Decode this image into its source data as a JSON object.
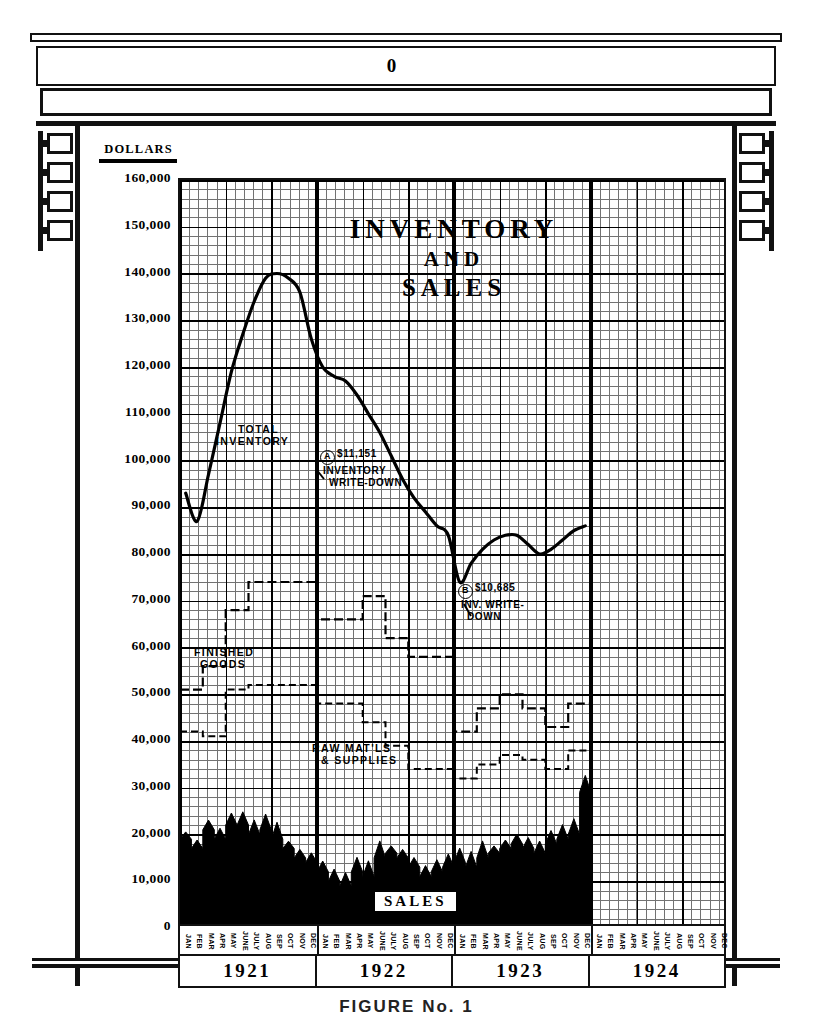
{
  "frame": {
    "header_mark": "0",
    "bracket_block_count": 4
  },
  "chart": {
    "title_line1": "INVENTORY",
    "title_line2": "AND",
    "title_line3": "SALES",
    "y_axis_header": "DOLLARS",
    "y_tick_labels": [
      "160,000",
      "150,000",
      "140,000",
      "130,000",
      "120,000",
      "110,000",
      "100,000",
      "90,000",
      "80,000",
      "70,000",
      "60,000",
      "50,000",
      "40,000",
      "30,000",
      "20,000",
      "10,000",
      "0"
    ],
    "series_label_total_inventory_l1": "TOTAL",
    "series_label_total_inventory_l2": "INVENTORY",
    "series_label_finished_goods_l1": "FINISHED",
    "series_label_finished_goods_l2": "GOODS",
    "series_label_raw_materials_l1": "RAW MAT'LS",
    "series_label_raw_materials_l2": "& SUPPLIES",
    "series_label_sales": "SALES",
    "annotation_a_marker": "A",
    "annotation_a_amount": "$11,151",
    "annotation_a_line2": "INVENTORY",
    "annotation_a_line3": "WRITE-DOWN",
    "annotation_b_marker": "B",
    "annotation_b_amount": "$10,685",
    "annotation_b_line2": "INV. WRITE-",
    "annotation_b_line3": "DOWN",
    "year_labels": [
      "1921",
      "1922",
      "1923",
      "1924"
    ],
    "month_labels": [
      "JAN",
      "FEB",
      "MAR",
      "APR",
      "MAY",
      "JUNE",
      "JULY",
      "AUG",
      "SEP",
      "OCT",
      "NOV",
      "DEC"
    ],
    "ink_color": "#000000",
    "grid_color": "#5a5a5a",
    "paper_color": "#ffffff"
  },
  "caption": "FIGURE  No. 1",
  "chart_data": {
    "type": "line",
    "title": "INVENTORY AND SALES",
    "xlabel": "",
    "ylabel": "DOLLARS",
    "ylim": [
      0,
      165000
    ],
    "ytick_step": 10000,
    "grid": true,
    "legend": "inline-labels",
    "x": [
      "1921-JAN",
      "1921-FEB",
      "1921-MAR",
      "1921-APR",
      "1921-MAY",
      "1921-JUNE",
      "1921-JULY",
      "1921-AUG",
      "1921-SEP",
      "1921-OCT",
      "1921-NOV",
      "1921-DEC",
      "1922-JAN",
      "1922-FEB",
      "1922-MAR",
      "1922-APR",
      "1922-MAY",
      "1922-JUNE",
      "1922-JULY",
      "1922-AUG",
      "1922-SEP",
      "1922-OCT",
      "1922-NOV",
      "1922-DEC",
      "1923-JAN",
      "1923-FEB",
      "1923-MAR",
      "1923-APR",
      "1923-MAY",
      "1923-JUNE",
      "1923-JULY",
      "1923-AUG",
      "1923-SEP",
      "1923-OCT",
      "1923-NOV",
      "1923-DEC"
    ],
    "series": [
      {
        "name": "TOTAL INVENTORY",
        "style": "solid-line",
        "values": [
          93000,
          87000,
          97000,
          108000,
          119000,
          127000,
          134000,
          139000,
          140000,
          139000,
          136000,
          126000,
          120000,
          118000,
          117000,
          114000,
          110000,
          106000,
          101000,
          96000,
          92000,
          89000,
          86000,
          84000,
          74000,
          78000,
          81000,
          83000,
          84000,
          84000,
          82000,
          80000,
          81000,
          83000,
          85000,
          86000
        ]
      },
      {
        "name": "FINISHED GOODS",
        "style": "dashed-step",
        "values": [
          51000,
          51000,
          56000,
          56000,
          68000,
          68000,
          74000,
          74000,
          74000,
          74000,
          74000,
          74000,
          66000,
          66000,
          66000,
          66000,
          71000,
          71000,
          62000,
          62000,
          58000,
          58000,
          58000,
          58000,
          42000,
          42000,
          47000,
          47000,
          50000,
          50000,
          47000,
          47000,
          43000,
          43000,
          48000,
          48000
        ]
      },
      {
        "name": "RAW MAT'LS & SUPPLIES",
        "style": "dashed-step",
        "values": [
          42000,
          42000,
          41000,
          41000,
          51000,
          51000,
          52000,
          52000,
          52000,
          52000,
          52000,
          52000,
          48000,
          48000,
          48000,
          48000,
          44000,
          44000,
          39000,
          39000,
          34000,
          34000,
          34000,
          34000,
          32000,
          32000,
          35000,
          35000,
          37000,
          37000,
          36000,
          36000,
          34000,
          34000,
          38000,
          38000
        ]
      },
      {
        "name": "SALES",
        "style": "filled-area-black",
        "values": [
          19000,
          17000,
          21000,
          19000,
          22000,
          22000,
          20000,
          21000,
          19000,
          17000,
          15000,
          14000,
          12000,
          10000,
          9000,
          12000,
          11000,
          15000,
          16000,
          15000,
          13000,
          11000,
          12000,
          13000,
          14000,
          13000,
          15000,
          16000,
          17000,
          18000,
          17000,
          16000,
          18000,
          19000,
          20000,
          29000
        ]
      }
    ],
    "annotations": [
      {
        "marker": "A",
        "amount": "$11,151",
        "text": "INVENTORY WRITE-DOWN",
        "at_x": "1921-DEC",
        "at_y": 130000
      },
      {
        "marker": "B",
        "amount": "$10,685",
        "text": "INV. WRITE-DOWN",
        "at_x": "1922-DEC",
        "at_y": 91000
      }
    ]
  }
}
